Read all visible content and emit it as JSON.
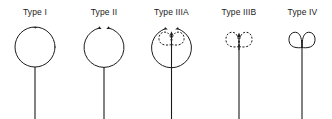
{
  "figure": {
    "name": "pituitary-stalk-morphology-types",
    "background_color": "#ffffff",
    "stroke_color": "#1b1b1b",
    "width": 332,
    "height": 119
  },
  "panels": [
    {
      "id": "type-1",
      "label": "Type I",
      "center_x": 35,
      "shape": "closed-circle-with-stem",
      "description": "Complete closed circle with a single arrowhead at the top and a straight vertical stem descending from the bottom of the circle.",
      "loop_style": "solid",
      "has_outer_circle": true,
      "outer_circle_open": false,
      "has_inner_dashed_loops": false,
      "has_solid_double_loops": false,
      "arrowhead_count": 1,
      "stem": true
    },
    {
      "id": "type-2",
      "label": "Type II",
      "center_x": 104,
      "shape": "open-circle-with-stem",
      "description": "Open circle with a gap at the top; both arc ends terminate in arrowheads curving inward. Straight vertical stem descends from the bottom.",
      "loop_style": "solid",
      "has_outer_circle": true,
      "outer_circle_open": true,
      "has_inner_dashed_loops": false,
      "has_solid_double_loops": false,
      "arrowhead_count": 2,
      "stem": true
    },
    {
      "id": "type-3a",
      "label": "Type IIIA",
      "center_x": 171,
      "shape": "open-circle-with-inner-dashed-double-loop",
      "description": "Open circle with arrowheads at both top ends, enclosing an inner dashed double loop (heart-like pair) with a central arrow pointing upward. Straight vertical stem descends through the centre.",
      "loop_style": "solid-outer-dashed-inner",
      "has_outer_circle": true,
      "outer_circle_open": true,
      "has_inner_dashed_loops": true,
      "has_solid_double_loops": false,
      "arrowhead_count": 3,
      "stem": true
    },
    {
      "id": "type-3b",
      "label": "Type IIIB",
      "center_x": 239,
      "shape": "dashed-double-loop-with-stem",
      "description": "Dashed double loop (two adjoining dashed lobes) with a central arrow pointing upward and a long straight vertical stem. No outer circle.",
      "loop_style": "dashed",
      "has_outer_circle": false,
      "outer_circle_open": false,
      "has_inner_dashed_loops": true,
      "has_solid_double_loops": false,
      "arrowhead_count": 1,
      "stem": true
    },
    {
      "id": "type-4",
      "label": "Type IV",
      "center_x": 302,
      "shape": "solid-double-loop-with-stem",
      "description": "Two solid adjoining loops forming a small butterfly shape atop a long straight vertical stem. No outer circle and no arrowheads.",
      "loop_style": "solid",
      "has_outer_circle": false,
      "outer_circle_open": false,
      "has_inner_dashed_loops": false,
      "has_solid_double_loops": true,
      "arrowhead_count": 0,
      "stem": true
    }
  ]
}
